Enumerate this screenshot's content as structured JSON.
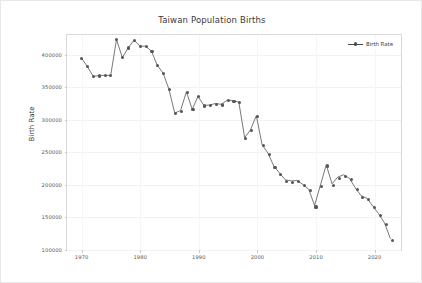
{
  "figure": {
    "width": 422,
    "height": 283,
    "background": "#ffffff"
  },
  "chart_data": {
    "type": "line",
    "title": "Taiwan Population Births",
    "xlabel": "",
    "ylabel": "Birth Rate",
    "legend": [
      {
        "name": "Birth Rate",
        "color": "#555555",
        "marker": "circle"
      }
    ],
    "legend_position": "top-right",
    "grid": true,
    "xlim": [
      1967.5,
      2024.5
    ],
    "ylim": [
      100000,
      430000
    ],
    "xticks": [
      1970,
      1980,
      1990,
      2000,
      2010,
      2020
    ],
    "xticklabels": [
      "1970",
      "1980",
      "1990",
      "2000",
      "2010",
      "2020"
    ],
    "yticks": [
      100000,
      150000,
      200000,
      250000,
      300000,
      350000,
      400000
    ],
    "yticklabels": [
      "100000",
      "150000",
      "200000",
      "250000",
      "300000",
      "350000",
      "400000"
    ],
    "line_color": "#555555",
    "marker_color": "#555555",
    "x": [
      1970,
      1971,
      1972,
      1973,
      1974,
      1975,
      1976,
      1977,
      1978,
      1979,
      1980,
      1981,
      1982,
      1983,
      1984,
      1985,
      1986,
      1987,
      1988,
      1989,
      1990,
      1991,
      1992,
      1993,
      1994,
      1995,
      1996,
      1997,
      1998,
      1999,
      2000,
      2001,
      2002,
      2003,
      2004,
      2005,
      2006,
      2007,
      2008,
      2009,
      2010,
      2011,
      2012,
      2013,
      2014,
      2015,
      2016,
      2017,
      2018,
      2019,
      2020,
      2021,
      2022,
      2023
    ],
    "series": [
      {
        "name": "Birth Rate",
        "values": [
          394000,
          381000,
          366000,
          367000,
          367500,
          367500,
          423000,
          395000,
          410000,
          422000,
          413000,
          412500,
          405000,
          383000,
          371000,
          346000,
          309000,
          313000,
          342000,
          315000,
          335000,
          321000,
          321500,
          324000,
          322500,
          329000,
          328500,
          326000,
          271000,
          283000,
          305000,
          260000,
          247000,
          227000,
          216000,
          205500,
          204000,
          204500,
          198500,
          191000,
          166000,
          197000,
          229000,
          199500,
          210000,
          213500,
          208000,
          193000,
          181000,
          177000,
          165000,
          153000,
          139000,
          115000
        ]
      }
    ]
  }
}
